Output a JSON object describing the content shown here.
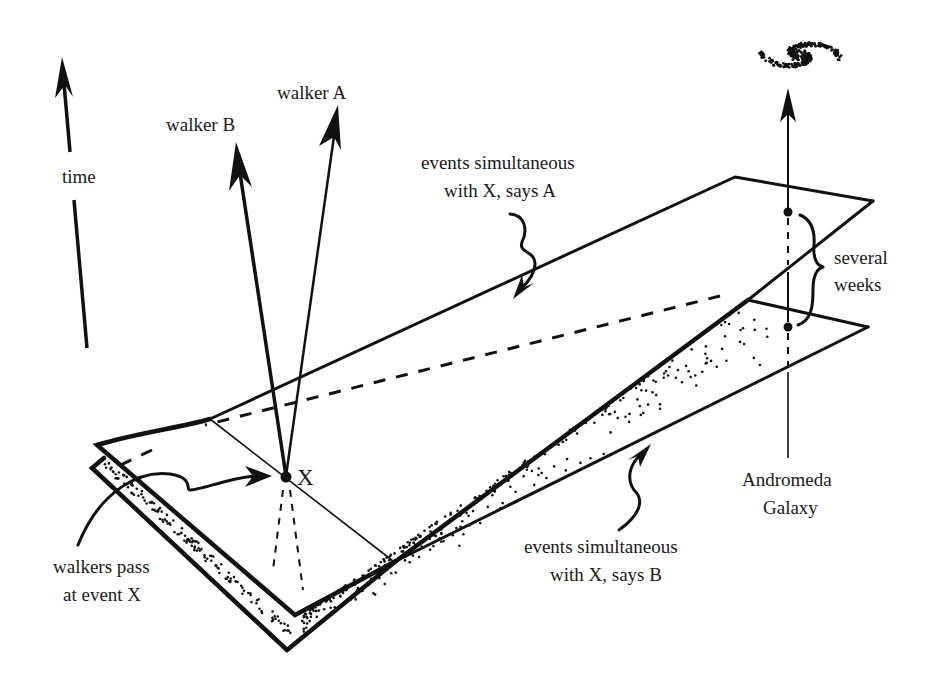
{
  "figure": {
    "type": "spacetime-diagram"
  },
  "labels": {
    "time": "time",
    "walker_b": "walker B",
    "walker_a": "walker A",
    "plane_a_line1": "events simultaneous",
    "plane_a_line2": "with X, says A",
    "several": "several",
    "weeks": "weeks",
    "event_x": "X",
    "pass_line1": "walkers pass",
    "pass_line2": "at event X",
    "andromeda_line1": "Andromeda",
    "andromeda_line2": "Galaxy",
    "plane_b_line1": "events simultaneous",
    "plane_b_line2": "with X, says B"
  },
  "icons": {
    "galaxy": "spiral-galaxy-dots",
    "time_arrow": "up-arrow",
    "walker_arrows": "up-arrow",
    "pointer_arrows": "squiggly-arrow"
  },
  "colors": {
    "ink": "#111111",
    "background": "#ffffff"
  }
}
